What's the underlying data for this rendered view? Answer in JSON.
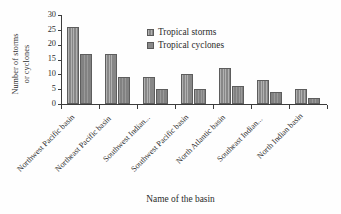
{
  "chart_data": {
    "type": "bar",
    "title": "",
    "xlabel": "Name of the basin",
    "ylabel": "Number of storms or cyclones",
    "ylabel_line1": "Number of storms",
    "ylabel_line2": "or cyclones",
    "ylim": [
      0,
      30
    ],
    "yticks": [
      0,
      5,
      10,
      15,
      20,
      25,
      30
    ],
    "ytick_labels": [
      "0",
      "5",
      "10",
      "15",
      "20",
      "25",
      "30"
    ],
    "grid": false,
    "legend_position": "upper right inside",
    "categories": [
      "Northwest Pacific basin",
      "Northeast Pacific basin",
      "Southwest Indian...",
      "Southwest Pacific basin",
      "North Atlantic basin",
      "Southeast Indian...",
      "North Indian basin"
    ],
    "series": [
      {
        "name": "Tropical storms",
        "color": "#8f8f8f",
        "values": [
          26,
          17,
          9,
          10,
          12,
          8,
          5
        ]
      },
      {
        "name": "Tropical cyclones",
        "color": "#898989",
        "values": [
          17,
          9,
          5,
          5,
          6,
          4,
          2
        ]
      }
    ]
  }
}
